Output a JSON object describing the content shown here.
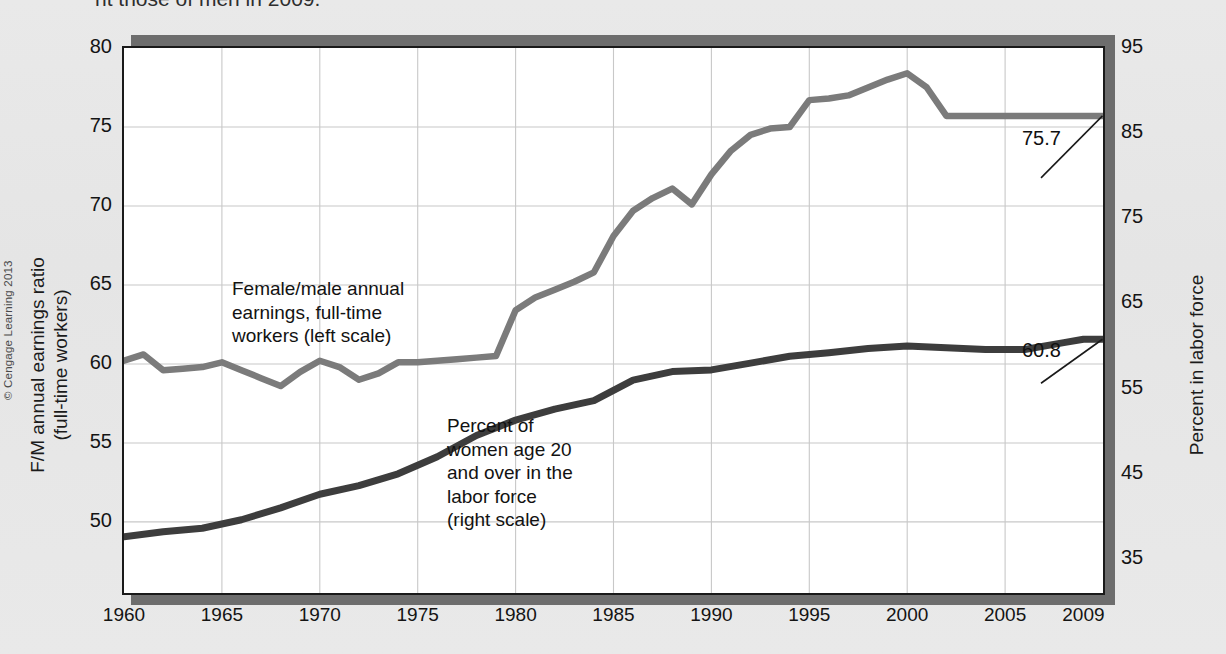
{
  "caption": {
    "text": "nt those of men in 2009."
  },
  "credit": "© Cengage Learning 2013",
  "axes": {
    "left_label": "F/M annual earnings ratio\n(full-time workers)",
    "left_label_line1": "F/M annual earnings ratio",
    "left_label_line2": "(full-time workers)",
    "right_label": "Percent in labor force"
  },
  "annotations": {
    "series1": "Female/male annual\nearnings, full-time\nworkers (left scale)",
    "series2": "Percent of\nwomen age 20\nand over in the\nlabor force\n(right scale)",
    "end_label_series1": "75.7",
    "end_label_series2": "60.8"
  },
  "colors": {
    "series1": "#7b7b7b",
    "series2": "#3d3d3d",
    "grid": "#c8c8c8",
    "frame": "#1a1a1a",
    "background": "#e8e8e8",
    "plot_background": "#ffffff",
    "shadow": "#6d6d6d"
  },
  "chart_data": {
    "type": "line",
    "title": "",
    "xlabel": "",
    "grid": true,
    "legend": "annotations-inline",
    "xlim": [
      1960,
      2010
    ],
    "x_ticks": [
      1960,
      1965,
      1970,
      1975,
      1980,
      1985,
      1990,
      1995,
      2000,
      2005,
      2009
    ],
    "x_tick_labels": [
      "1960",
      "1965",
      "1970",
      "1975",
      "1980",
      "1985",
      "1990",
      "1995",
      "2000",
      "2005",
      "2009"
    ],
    "left_axis": {
      "label": "F/M annual earnings ratio (full-time workers)",
      "ylim": [
        45.5,
        80
      ],
      "ticks": [
        50,
        55,
        60,
        65,
        70,
        75,
        80
      ],
      "tick_labels": [
        "50",
        "55",
        "60",
        "65",
        "70",
        "75",
        "80"
      ]
    },
    "right_axis": {
      "label": "Percent in labor force",
      "ylim": [
        31,
        95
      ],
      "ticks": [
        35,
        45,
        55,
        65,
        75,
        85,
        95
      ],
      "tick_labels": [
        "35",
        "45",
        "55",
        "65",
        "75",
        "85",
        "95"
      ]
    },
    "series": [
      {
        "name": "Female/male annual earnings, full-time workers (left scale)",
        "axis": "left",
        "color": "#7b7b7b",
        "x": [
          1960,
          1961,
          1962,
          1963,
          1964,
          1965,
          1966,
          1967,
          1968,
          1969,
          1970,
          1971,
          1972,
          1973,
          1974,
          1975,
          1976,
          1977,
          1978,
          1979,
          1980,
          1981,
          1982,
          1983,
          1984,
          1985,
          1986,
          1987,
          1988,
          1989,
          1990,
          1991,
          1992,
          1993,
          1994,
          1995,
          1996,
          1997,
          1998,
          1999,
          2000,
          2001,
          2002,
          2003,
          2004,
          2005,
          2006,
          2007,
          2008,
          2009,
          2010
        ],
        "values": [
          60.2,
          60.6,
          59.6,
          59.7,
          59.8,
          60.1,
          59.6,
          59.1,
          58.6,
          59.5,
          60.2,
          59.8,
          59.0,
          59.4,
          60.1,
          60.1,
          60.2,
          60.3,
          60.4,
          60.5,
          63.4,
          64.2,
          64.7,
          65.2,
          65.8,
          68.1,
          69.7,
          70.5,
          71.1,
          70.1,
          72.0,
          73.5,
          74.5,
          74.9,
          75.0,
          76.7,
          76.8,
          77.0,
          77.5,
          78.0,
          78.4,
          77.5,
          75.7,
          75.7,
          75.7,
          75.7,
          75.7,
          75.7,
          75.7,
          75.7,
          75.7
        ]
      },
      {
        "name": "Percent of women age 20 and over in the labor force (right scale)",
        "axis": "right",
        "color": "#3d3d3d",
        "x": [
          1960,
          1962,
          1964,
          1966,
          1968,
          1970,
          1972,
          1974,
          1976,
          1978,
          1980,
          1982,
          1984,
          1986,
          1988,
          1990,
          1992,
          1994,
          1996,
          1998,
          2000,
          2002,
          2004,
          2006,
          2008,
          2009,
          2010
        ],
        "values": [
          37.6,
          38.2,
          38.6,
          39.6,
          41.0,
          42.6,
          43.6,
          45.0,
          47.0,
          49.5,
          51.3,
          52.6,
          53.6,
          56.0,
          57.0,
          57.2,
          58.0,
          58.8,
          59.2,
          59.7,
          60.0,
          59.8,
          59.6,
          59.6,
          60.4,
          60.8,
          60.8
        ]
      }
    ],
    "annotated_points": [
      {
        "series": "Female/male annual earnings, full-time workers (left scale)",
        "x": 2009,
        "label": "75.7"
      },
      {
        "series": "Percent of women age 20 and over in the labor force (right scale)",
        "x": 2009,
        "label": "60.8"
      }
    ]
  }
}
